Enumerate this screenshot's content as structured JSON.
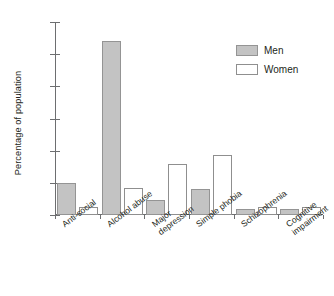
{
  "chart_data": {
    "type": "bar",
    "title": "",
    "subtitle": "",
    "xlabel": "",
    "ylabel": "Percentage of population",
    "ylim": [
      0,
      30
    ],
    "yticks": [
      0,
      5,
      10,
      15,
      20,
      25,
      30
    ],
    "ytick_labels": [
      "0",
      "5",
      "10",
      "15",
      "20",
      "25",
      "30"
    ],
    "grid": false,
    "legend_position": "top-right",
    "categories": [
      "Anti-social",
      "Alcohol abuse",
      "Major\ndepression",
      "Simple phobia",
      "Schizophrenia",
      "Cognitive\nimpairment"
    ],
    "series": [
      {
        "name": "Men",
        "color": "#c3c3c3",
        "values": [
          5.0,
          27.0,
          2.4,
          4.0,
          0.9,
          0.9
        ]
      },
      {
        "name": "Women",
        "color": "#ffffff",
        "values": [
          1.2,
          4.2,
          8.0,
          9.4,
          1.2,
          1.2
        ]
      }
    ]
  },
  "legend": {
    "items": [
      {
        "label": "Men",
        "swatch": "men"
      },
      {
        "label": "Women",
        "swatch": "women"
      }
    ]
  }
}
